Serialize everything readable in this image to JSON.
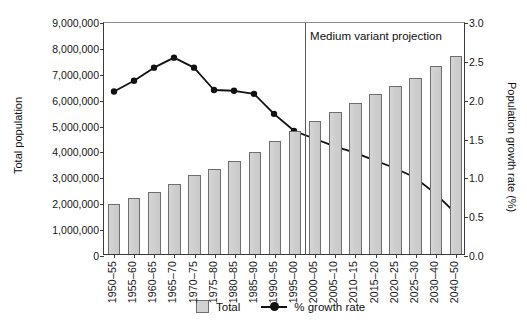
{
  "chart_data": {
    "type": "bar",
    "title": "",
    "xlabel": "",
    "ylabel": "Total population",
    "y2label": "Population growth rate (%)",
    "ylim": [
      0,
      9000000
    ],
    "y2lim": [
      0,
      3.0
    ],
    "grid": false,
    "legend_position": "bottom-center",
    "categories": [
      "1950–55",
      "1955–60",
      "1960–65",
      "1965–70",
      "1970–75",
      "1975–80",
      "1980–85",
      "1985–90",
      "1990–95",
      "1995–00",
      "2000–05",
      "2005–10",
      "2010–15",
      "2015–20",
      "2020–25",
      "2025–30",
      "2030–40",
      "2040–50"
    ],
    "series": [
      {
        "name": "Total",
        "type": "bar",
        "axis": "left",
        "color": "#d2d2d2",
        "values": [
          1950000,
          2150000,
          2400000,
          2700000,
          3050000,
          3300000,
          3600000,
          3950000,
          4350000,
          4750000,
          5150000,
          5500000,
          5850000,
          6200000,
          6500000,
          6800000,
          7250000,
          7650000
        ]
      },
      {
        "name": "% growth rate",
        "type": "line",
        "axis": "right",
        "color": "#111111",
        "values": [
          2.11,
          2.25,
          2.42,
          2.55,
          2.42,
          2.13,
          2.12,
          2.08,
          1.82,
          1.6,
          1.5,
          1.4,
          1.32,
          1.22,
          1.12,
          1.0,
          0.8,
          0.55
        ]
      }
    ],
    "y_ticks": [
      "0",
      "1,000,000",
      "2,000,000",
      "3,000,000",
      "4,000,000",
      "5,000,000",
      "6,000,000",
      "7,000,000",
      "8,000,000",
      "9,000,000"
    ],
    "y_tick_values": [
      0,
      1000000,
      2000000,
      3000000,
      4000000,
      5000000,
      6000000,
      7000000,
      8000000,
      9000000
    ],
    "y2_ticks": [
      "0.0",
      "0.5",
      "1.0",
      "1.5",
      "2.0",
      "2.5",
      "3.0"
    ],
    "y2_tick_values": [
      0.0,
      0.5,
      1.0,
      1.5,
      2.0,
      2.5,
      3.0
    ],
    "annotations": [
      {
        "text": "Medium variant projection",
        "divider_after_category": "1995–00"
      }
    ]
  },
  "legend": {
    "bar_label": "Total",
    "line_label": "% growth rate"
  },
  "colors": {
    "bar_fill": "#d2d2d2",
    "bar_stroke": "#6e6e6e",
    "line": "#111111",
    "axis": "#3a3a3a",
    "text": "#151515"
  }
}
